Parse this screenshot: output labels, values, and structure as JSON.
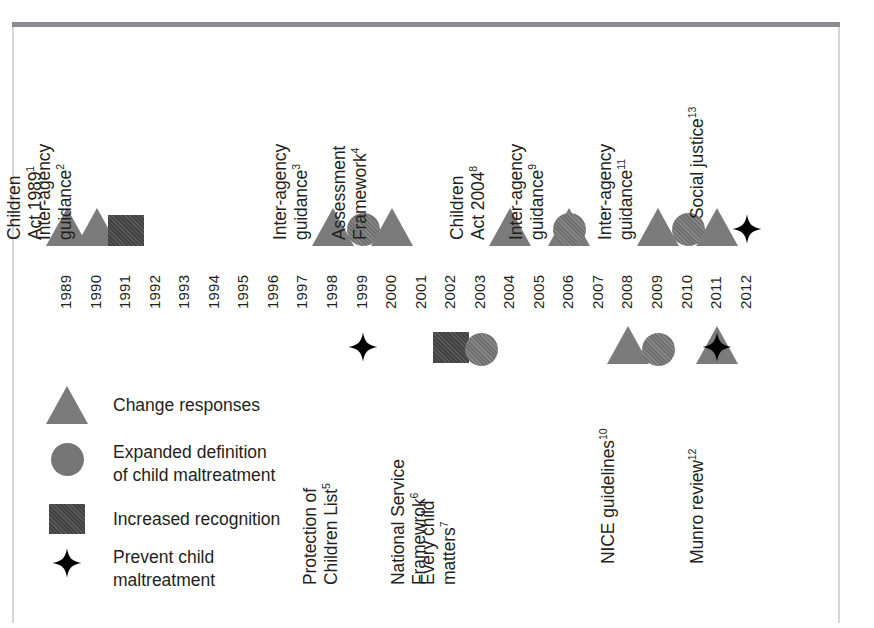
{
  "figure": {
    "type": "timeline",
    "axis": {
      "years": [
        "1989",
        "1990",
        "1991",
        "1992",
        "1993",
        "1994",
        "1995",
        "1996",
        "1997",
        "1998",
        "1999",
        "2000",
        "2001",
        "2002",
        "2003",
        "2004",
        "2005",
        "2006",
        "2007",
        "2008",
        "2009",
        "2010",
        "2011",
        "2012"
      ],
      "start_year": 1989,
      "end_year": 2012
    },
    "colors": {
      "triangle": "#7b7b7b",
      "circle": "#767676",
      "square": "#4a4a4a",
      "star": "#000000",
      "text": "#231f20",
      "frame_top": "#8a8e92",
      "frame_side": "#d4d6d8"
    }
  },
  "events_above": [
    {
      "id": "children-act-1989",
      "label_lines": [
        "Children",
        "Act 1989"
      ],
      "superscript": "1",
      "year": 1989,
      "markers": [
        {
          "shape": "triangle",
          "year": 1989
        }
      ]
    },
    {
      "id": "inter-agency-guidance-1991",
      "label_lines": [
        "Inter-agency",
        "guidance"
      ],
      "superscript": "2",
      "year": 1991,
      "markers": [
        {
          "shape": "triangle",
          "year": 1990
        },
        {
          "shape": "square",
          "year": 1991
        }
      ]
    },
    {
      "id": "inter-agency-guidance-1999",
      "label_lines": [
        "Inter-agency",
        "guidance"
      ],
      "superscript": "3",
      "year": 1999,
      "markers": [
        {
          "shape": "triangle",
          "year": 1998
        },
        {
          "shape": "circle",
          "year": 1999
        }
      ]
    },
    {
      "id": "assessment-framework-2000",
      "label_lines": [
        "Assessment",
        "Framework"
      ],
      "superscript": "4",
      "year": 2000,
      "markers": [
        {
          "shape": "triangle",
          "year": 2000
        }
      ]
    },
    {
      "id": "children-act-2004",
      "label_lines": [
        "Children",
        "Act 2004"
      ],
      "superscript": "8",
      "year": 2004,
      "markers": [
        {
          "shape": "triangle",
          "year": 2004
        }
      ]
    },
    {
      "id": "inter-agency-guidance-2006",
      "label_lines": [
        "Inter-agency",
        "guidance"
      ],
      "superscript": "9",
      "year": 2006,
      "markers": [
        {
          "shape": "triangle",
          "year": 2006
        },
        {
          "shape": "circle",
          "year": 2006
        }
      ]
    },
    {
      "id": "inter-agency-guidance-2010",
      "label_lines": [
        "Inter-agency",
        "guidance"
      ],
      "superscript": "11",
      "year": 2010,
      "markers": [
        {
          "shape": "triangle",
          "year": 2009
        },
        {
          "shape": "circle",
          "year": 2010
        }
      ]
    },
    {
      "id": "social-justice-2012",
      "label_lines": [
        "Social justice"
      ],
      "superscript": "13",
      "year": 2012,
      "markers": [
        {
          "shape": "triangle",
          "year": 2011
        },
        {
          "shape": "star",
          "year": 2012
        }
      ]
    }
  ],
  "events_below": [
    {
      "id": "protection-of-children-list",
      "label_lines": [
        "Protection of",
        "Children List"
      ],
      "superscript": "5",
      "year": 1999,
      "markers": [
        {
          "shape": "star",
          "year": 1999
        }
      ]
    },
    {
      "id": "national-service-framework",
      "label_lines": [
        "National Service",
        "Framewrok"
      ],
      "superscript": "6",
      "year": 2002,
      "markers": [
        {
          "shape": "square",
          "year": 2002
        }
      ]
    },
    {
      "id": "every-child-matters",
      "label_lines": [
        "Every child",
        "matters"
      ],
      "superscript": "7",
      "year": 2003,
      "markers": [
        {
          "shape": "circle",
          "year": 2003
        }
      ]
    },
    {
      "id": "nice-guidelines",
      "label_lines": [
        "NICE guidelines"
      ],
      "superscript": "10",
      "year": 2009,
      "markers": [
        {
          "shape": "triangle",
          "year": 2008
        },
        {
          "shape": "circle",
          "year": 2009
        }
      ]
    },
    {
      "id": "munro-review",
      "label_lines": [
        "Munro review"
      ],
      "superscript": "12",
      "year": 2011,
      "markers": [
        {
          "shape": "triangle",
          "year": 2011
        },
        {
          "shape": "star",
          "year": 2011
        }
      ]
    }
  ],
  "legend": {
    "items": [
      {
        "shape": "triangle",
        "label": "Change responses"
      },
      {
        "shape": "circle",
        "label": "Expanded definition\nof child maltreatment"
      },
      {
        "shape": "square",
        "label": "Increased recognition"
      },
      {
        "shape": "star",
        "label": "Prevent child\nmaltreatment"
      }
    ]
  }
}
